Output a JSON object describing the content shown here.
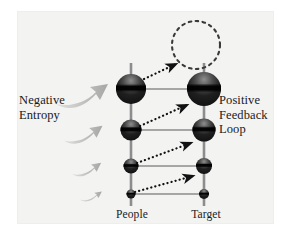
{
  "figure": {
    "name": "negative-entropy-positive-feedback-loop-diagram",
    "background_color": "#ffffff",
    "panel_color": "#f3f3f2"
  },
  "labels": {
    "left": "Negative\nEntropy",
    "right": "Positive\nFeedback\nLoop",
    "bottom_left": "People",
    "bottom_right": "Target"
  },
  "colors": {
    "sphere_dark": "#1c1c1c",
    "sphere_mid": "#555555",
    "sphere_light": "#9a9a9a",
    "connector": "#8d8d8d",
    "dotted_arrow": "#111111",
    "entropy_arrow": "#b9b9b9",
    "dashed_circle": "#3a3a3a",
    "text": "#1a1a1a"
  },
  "columns": [
    {
      "name": "people",
      "x": 131,
      "label": "People"
    },
    {
      "name": "target",
      "x": 204,
      "label": "Target"
    }
  ],
  "nodes": [
    {
      "name": "people-node-1",
      "column": "people",
      "cx": 131,
      "cy": 89,
      "r": 15
    },
    {
      "name": "people-node-2",
      "column": "people",
      "cx": 131,
      "cy": 130,
      "r": 10.5
    },
    {
      "name": "people-node-3",
      "column": "people",
      "cx": 131,
      "cy": 166,
      "r": 7.5
    },
    {
      "name": "people-node-4",
      "column": "people",
      "cx": 131,
      "cy": 194,
      "r": 4.5
    },
    {
      "name": "target-node-1",
      "column": "target",
      "cx": 204,
      "cy": 89,
      "r": 17
    },
    {
      "name": "target-node-2",
      "column": "target",
      "cx": 204,
      "cy": 130,
      "r": 11.5
    },
    {
      "name": "target-node-3",
      "column": "target",
      "cx": 204,
      "cy": 166,
      "r": 8
    },
    {
      "name": "target-node-4",
      "column": "target",
      "cx": 204,
      "cy": 194,
      "r": 5
    }
  ],
  "dashed_circle": {
    "name": "empty-future-node",
    "cx": 196,
    "cy": 45,
    "r": 24
  },
  "connectors": [
    {
      "name": "rung-1",
      "x1": 131,
      "y1": 89,
      "x2": 204,
      "y2": 89
    },
    {
      "name": "rung-2",
      "x1": 131,
      "y1": 130,
      "x2": 204,
      "y2": 130
    },
    {
      "name": "rung-3",
      "x1": 131,
      "y1": 166,
      "x2": 204,
      "y2": 166
    },
    {
      "name": "rung-4",
      "x1": 131,
      "y1": 194,
      "x2": 204,
      "y2": 194
    }
  ],
  "dotted_arrows": [
    {
      "name": "feedback-arrow-1",
      "x1": 143,
      "y1": 79,
      "x2": 177,
      "y2": 63
    },
    {
      "name": "feedback-arrow-2",
      "x1": 139,
      "y1": 126,
      "x2": 188,
      "y2": 104
    },
    {
      "name": "feedback-arrow-3",
      "x1": 136,
      "y1": 163,
      "x2": 192,
      "y2": 142
    },
    {
      "name": "feedback-arrow-4",
      "x1": 134,
      "y1": 192,
      "x2": 194,
      "y2": 175
    }
  ],
  "entropy_arrows": [
    {
      "name": "entropy-arrow-1",
      "cy": 92,
      "scale": 1.0
    },
    {
      "name": "entropy-arrow-2",
      "cy": 131,
      "scale": 0.78
    },
    {
      "name": "entropy-arrow-3",
      "cy": 166,
      "scale": 0.6
    },
    {
      "name": "entropy-arrow-4",
      "cy": 194,
      "scale": 0.44
    }
  ]
}
